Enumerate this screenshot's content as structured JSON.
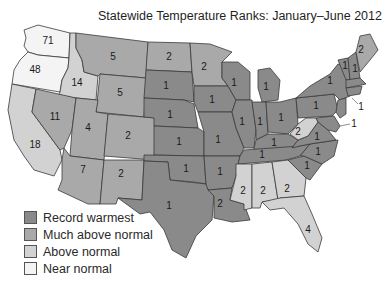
{
  "title": "Statewide Temperature Ranks: January–June 2012",
  "colors": {
    "record_warmest": "#8a8a8a",
    "much_above_normal": "#a9a9a9",
    "above_normal": "#d2d2d2",
    "near_normal": "#f4f4f4"
  },
  "legend": [
    {
      "label": "Record warmest",
      "color": "#8a8a8a"
    },
    {
      "label": "Much above normal",
      "color": "#a9a9a9"
    },
    {
      "label": "Above normal",
      "color": "#d2d2d2"
    },
    {
      "label": "Near normal",
      "color": "#f4f4f4"
    }
  ],
  "states": {
    "WA": {
      "rank": "71",
      "category": "near_normal"
    },
    "OR": {
      "rank": "48",
      "category": "near_normal"
    },
    "ID": {
      "rank": "14",
      "category": "above_normal"
    },
    "CA": {
      "rank": "18",
      "category": "above_normal"
    },
    "NV": {
      "rank": "11",
      "category": "much_above_normal"
    },
    "MT": {
      "rank": "5",
      "category": "much_above_normal"
    },
    "WY": {
      "rank": "5",
      "category": "much_above_normal"
    },
    "UT": {
      "rank": "4",
      "category": "much_above_normal"
    },
    "CO": {
      "rank": "2",
      "category": "much_above_normal"
    },
    "AZ": {
      "rank": "7",
      "category": "much_above_normal"
    },
    "NM": {
      "rank": "2",
      "category": "much_above_normal"
    },
    "ND": {
      "rank": "2",
      "category": "much_above_normal"
    },
    "SD": {
      "rank": "1",
      "category": "record_warmest"
    },
    "NE": {
      "rank": "1",
      "category": "record_warmest"
    },
    "KS": {
      "rank": "1",
      "category": "record_warmest"
    },
    "OK": {
      "rank": "1",
      "category": "record_warmest"
    },
    "TX": {
      "rank": "1",
      "category": "record_warmest"
    },
    "MN": {
      "rank": "2",
      "category": "much_above_normal"
    },
    "IA": {
      "rank": "1",
      "category": "record_warmest"
    },
    "MO": {
      "rank": "1",
      "category": "record_warmest"
    },
    "AR": {
      "rank": "1",
      "category": "record_warmest"
    },
    "LA": {
      "rank": "2",
      "category": "much_above_normal"
    },
    "WI": {
      "rank": "1",
      "category": "record_warmest"
    },
    "IL": {
      "rank": "1",
      "category": "record_warmest"
    },
    "MI": {
      "rank": "1",
      "category": "record_warmest"
    },
    "IN": {
      "rank": "1",
      "category": "record_warmest"
    },
    "OH": {
      "rank": "1",
      "category": "record_warmest"
    },
    "KY": {
      "rank": "1",
      "category": "record_warmest"
    },
    "TN": {
      "rank": "1",
      "category": "record_warmest"
    },
    "MS": {
      "rank": "2",
      "category": "above_normal"
    },
    "AL": {
      "rank": "2",
      "category": "above_normal"
    },
    "GA": {
      "rank": "2",
      "category": "above_normal"
    },
    "FL": {
      "rank": "4",
      "category": "above_normal"
    },
    "SC": {
      "rank": "1",
      "category": "record_warmest"
    },
    "NC": {
      "rank": "1",
      "category": "record_warmest"
    },
    "VA": {
      "rank": "1",
      "category": "record_warmest"
    },
    "WV": {
      "rank": "2",
      "category": "above_normal"
    },
    "PA": {
      "rank": "1",
      "category": "record_warmest"
    },
    "NY": {
      "rank": "1",
      "category": "record_warmest"
    },
    "VT": {
      "rank": "1",
      "category": "record_warmest"
    },
    "NH": {
      "rank": "1",
      "category": "record_warmest"
    },
    "ME": {
      "rank": "2",
      "category": "much_above_normal"
    },
    "MA": {
      "rank": "1",
      "category": "record_warmest"
    },
    "CT_RI": {
      "rank": "1",
      "category": "record_warmest"
    },
    "NJ": {
      "rank": "1",
      "category": "record_warmest"
    },
    "DE_MD": {
      "rank": "1",
      "category": "record_warmest"
    }
  },
  "callouts": {
    "northeast": "1",
    "mid_atlantic": "1"
  }
}
